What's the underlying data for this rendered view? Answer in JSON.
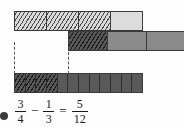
{
  "figure": {
    "type": "fraction-bar-diagram"
  },
  "bars": {
    "top": {
      "name": "three-quarters-bar",
      "total_cells": 4,
      "shaded_cells": 3,
      "fraction_label": "3/4",
      "cells": [
        {
          "fill": "hatch-light"
        },
        {
          "fill": "hatch-light"
        },
        {
          "fill": "hatch-light"
        },
        {
          "fill": "light"
        }
      ]
    },
    "middle": {
      "name": "one-third-bar",
      "total_cells": 3,
      "shaded_cells": 1,
      "fraction_label": "1/3",
      "cells": [
        {
          "fill": "hatch-dark"
        },
        {
          "fill": "mid"
        },
        {
          "fill": "mid"
        }
      ]
    },
    "bottom": {
      "name": "five-twelfths-result-bar",
      "total_cells": 12,
      "shaded_cells": 5,
      "fraction_label": "5/12",
      "cells": [
        {
          "fill": "hatch-dark"
        },
        {
          "fill": "hatch-dark"
        },
        {
          "fill": "hatch-dark"
        },
        {
          "fill": "hatch-dark"
        },
        {
          "fill": "dark"
        },
        {
          "fill": "dark"
        },
        {
          "fill": "dark"
        },
        {
          "fill": "dark"
        },
        {
          "fill": "dark"
        },
        {
          "fill": "dark"
        },
        {
          "fill": "dark"
        },
        {
          "fill": "dark"
        }
      ]
    }
  },
  "equation": {
    "text": "3/4 - 1/3 = 5/12",
    "terms": [
      {
        "numerator": "3",
        "denominator": "4"
      },
      {
        "numerator": "1",
        "denominator": "3"
      },
      {
        "numerator": "5",
        "denominator": "12"
      }
    ],
    "minus_sign": "−",
    "equals_sign": "="
  },
  "colors": {
    "hatch_light_bg": "#d9d9d9",
    "light_bg": "#dcdcdc",
    "mid_bg": "#8a8a8a",
    "dark_bg": "#595959",
    "stroke": "#3a3a3a",
    "text": "#1a1a1a",
    "page_bg": "#fefefe"
  },
  "guides": {
    "left_label": "left-alignment-guide",
    "right_label": "right-alignment-guide"
  }
}
